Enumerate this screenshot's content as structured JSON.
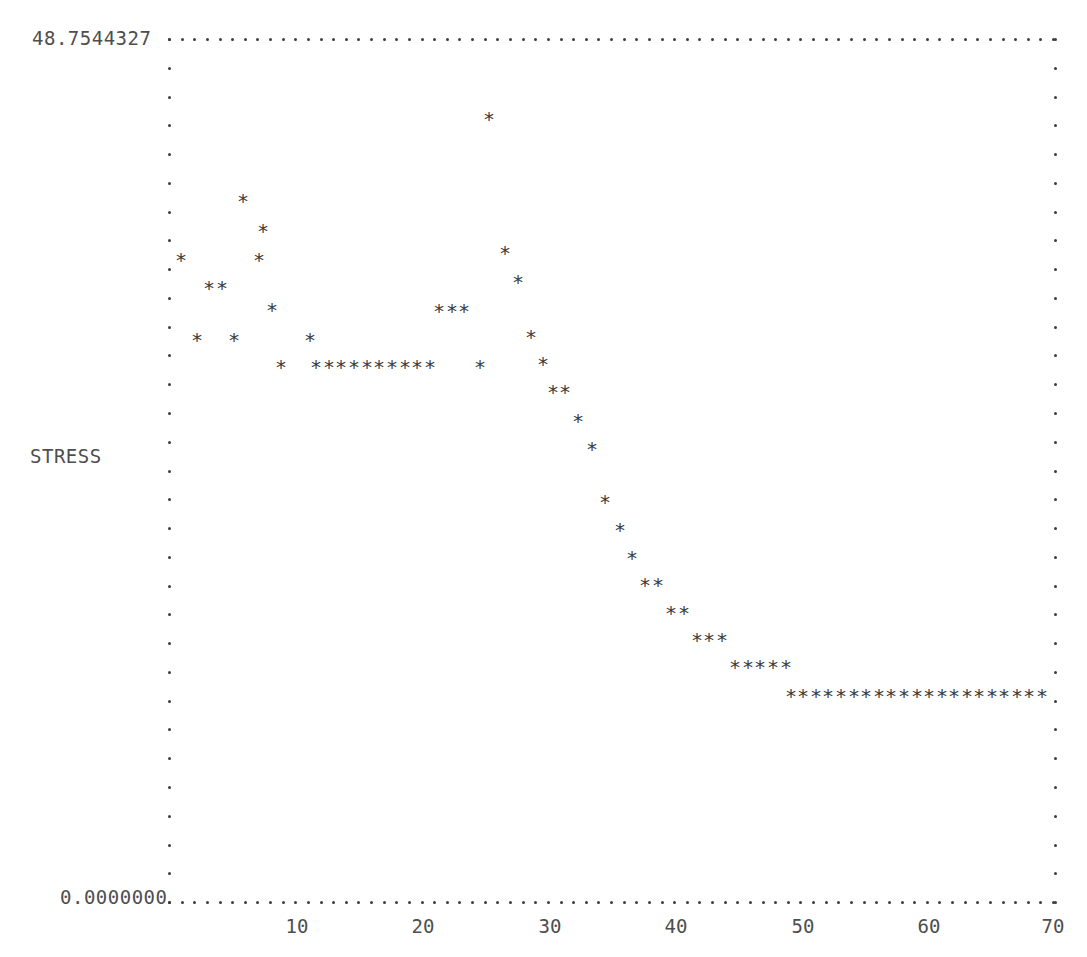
{
  "plot": {
    "y_axis_label": "STRESS",
    "y_max_label": "48.7544327",
    "y_min_label": "0.0000000",
    "x_tick_labels": [
      "10",
      "20",
      "30",
      "40",
      "50",
      "60",
      "70"
    ],
    "marker_glyph": "*",
    "axis_glyph": ".",
    "marker_color": "#3a3a3a",
    "axis_color": "#3d3d3d",
    "text_color": "#4e4e4e",
    "background_color": "#ffffff"
  },
  "chart_data": {
    "type": "scatter",
    "title": "",
    "xlabel": "",
    "ylabel": "STRESS",
    "xlim": [
      0,
      71
    ],
    "ylim": [
      0.0,
      48.7544327
    ],
    "grid": false,
    "legend": null,
    "y_tick_labels": [
      "48.7544327",
      "0.0000000"
    ],
    "x_tick_labels": [
      "10",
      "20",
      "30",
      "40",
      "50",
      "60",
      "70"
    ],
    "x_ticks": [
      10,
      20,
      30,
      40,
      50,
      60,
      70
    ],
    "series": [
      {
        "name": "STRESS",
        "x": [
          1,
          2,
          3,
          4,
          5,
          6,
          7,
          8,
          9,
          10,
          11,
          12,
          13,
          14,
          15,
          16,
          17,
          18,
          19,
          20,
          21,
          22,
          23,
          24,
          25,
          26,
          27,
          28,
          29,
          30,
          31,
          32,
          33,
          34,
          35,
          36,
          37,
          38,
          39,
          40,
          41,
          42,
          43,
          44,
          45,
          46,
          47,
          48,
          49,
          50,
          51,
          52,
          53,
          54,
          55,
          56,
          57,
          58,
          59,
          60,
          61,
          62,
          63,
          64,
          65,
          66,
          67,
          68,
          69,
          70
        ],
        "y": [
          31.9,
          29.0,
          29.0,
          34.9,
          31.9,
          26.1,
          23.2,
          23.2,
          33.5,
          26.1,
          36.4,
          23.2,
          23.2,
          23.2,
          23.2,
          23.2,
          23.2,
          23.2,
          23.2,
          23.2,
          27.5,
          27.5,
          27.5,
          23.2,
          43.6,
          33.5,
          31.9,
          26.1,
          24.6,
          23.2,
          21.8,
          21.8,
          20.3,
          18.9,
          15.9,
          14.5,
          13.1,
          11.6,
          11.6,
          10.2,
          10.2,
          8.7,
          8.7,
          8.7,
          7.3,
          7.3,
          7.3,
          7.3,
          7.3,
          5.8,
          5.8,
          5.8,
          5.8,
          5.8,
          5.8,
          5.8,
          5.8,
          5.8,
          5.8,
          5.8,
          5.8,
          5.8,
          5.8,
          5.8,
          5.8,
          5.8,
          5.8,
          5.8,
          5.8,
          5.8
        ]
      }
    ],
    "points_px": [
      [
        181,
        260
      ],
      [
        209,
        288
      ],
      [
        222,
        288
      ],
      [
        243,
        201
      ],
      [
        259,
        260
      ],
      [
        272,
        310
      ],
      [
        197,
        340
      ],
      [
        234,
        340
      ],
      [
        263,
        231
      ],
      [
        281,
        367
      ],
      [
        310,
        340
      ],
      [
        316,
        367
      ],
      [
        329,
        367
      ],
      [
        341,
        367
      ],
      [
        354,
        367
      ],
      [
        367,
        367
      ],
      [
        379,
        367
      ],
      [
        392,
        367
      ],
      [
        405,
        367
      ],
      [
        417,
        367
      ],
      [
        430,
        367
      ],
      [
        439,
        311
      ],
      [
        452,
        311
      ],
      [
        464,
        311
      ],
      [
        480,
        367
      ],
      [
        489,
        119
      ],
      [
        505,
        253
      ],
      [
        518,
        282
      ],
      [
        531,
        337
      ],
      [
        543,
        364
      ],
      [
        553,
        392
      ],
      [
        565,
        392
      ],
      [
        578,
        421
      ],
      [
        592,
        449
      ],
      [
        605,
        502
      ],
      [
        620,
        530
      ],
      [
        632,
        558
      ],
      [
        645,
        585
      ],
      [
        658,
        585
      ],
      [
        671,
        613
      ],
      [
        684,
        613
      ],
      [
        697,
        640
      ],
      [
        709,
        640
      ],
      [
        722,
        640
      ],
      [
        735,
        667
      ],
      [
        748,
        667
      ],
      [
        760,
        667
      ],
      [
        773,
        667
      ],
      [
        786,
        667
      ],
      [
        791,
        696
      ],
      [
        803,
        696
      ],
      [
        816,
        696
      ],
      [
        828,
        696
      ],
      [
        841,
        696
      ],
      [
        854,
        696
      ],
      [
        866,
        696
      ],
      [
        879,
        696
      ],
      [
        891,
        696
      ],
      [
        904,
        696
      ],
      [
        917,
        696
      ],
      [
        929,
        696
      ],
      [
        942,
        696
      ],
      [
        954,
        696
      ],
      [
        967,
        696
      ],
      [
        979,
        696
      ],
      [
        992,
        696
      ],
      [
        1004,
        696
      ],
      [
        1017,
        696
      ],
      [
        1029,
        696
      ],
      [
        1042,
        696
      ]
    ]
  },
  "geometry": {
    "left_px": 168,
    "right_px": 1054,
    "top_px": 38,
    "bottom_px": 901,
    "x_tick_px": [
      297,
      423,
      550,
      676,
      803,
      929,
      1053
    ],
    "x_tick_label_y_px": 915
  }
}
